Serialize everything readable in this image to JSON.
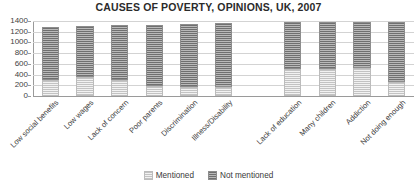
{
  "chart_data": {
    "type": "bar",
    "subtype": "stacked-column",
    "title": "CAUSES OF POVERTY, OPINIONS, UK, 2007",
    "xlabel": "",
    "ylabel": "",
    "ylim": [
      0,
      1400
    ],
    "ytick_step": 200,
    "yticks": [
      1400,
      1200,
      1000,
      800,
      600,
      400,
      200,
      0
    ],
    "grid": true,
    "legend_position": "bottom",
    "categories": [
      "Low social benefits",
      "Low wages",
      "Lack of concern",
      "Poor parents",
      "Discrimination",
      "Illness/Disability",
      "Lack of education",
      "Many children",
      "Addiction",
      "Not doing enough"
    ],
    "series": [
      {
        "name": "Mentioned",
        "color": "#e3e3e3",
        "values": [
          300,
          350,
          300,
          180,
          160,
          170,
          510,
          500,
          520,
          260
        ]
      },
      {
        "name": "Not mentioned",
        "color": "#9b9b9b",
        "values": [
          990,
          960,
          1020,
          1150,
          1190,
          1190,
          870,
          880,
          860,
          1130
        ]
      }
    ],
    "totals": [
      1290,
      1310,
      1320,
      1330,
      1350,
      1360,
      1380,
      1380,
      1380,
      1390
    ],
    "gap_after_category_index": 5
  },
  "legend": {
    "items": [
      {
        "label": "Mentioned",
        "swatch": "legend-swatch-mentioned"
      },
      {
        "label": "Not mentioned",
        "swatch": "legend-swatch-not-mentioned"
      }
    ]
  }
}
